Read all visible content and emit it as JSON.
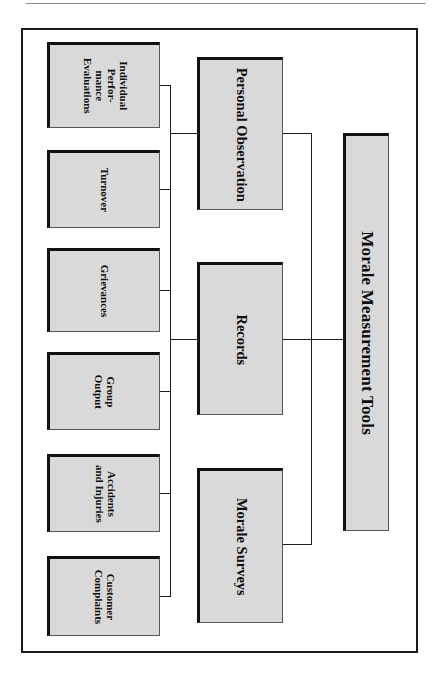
{
  "figure": {
    "type": "org-chart",
    "orientation": "rotated-90-clockwise",
    "title": "Morale Measurement Tools",
    "root": {
      "label": "Morale Measurement Tools"
    },
    "branches": [
      {
        "label": "Personal Observation",
        "children": [
          {
            "label": "Individual\nPerfor-\nmance\nEvaluations"
          },
          {
            "label": "Turnover"
          },
          {
            "label": "Grievances"
          }
        ]
      },
      {
        "label": "Records",
        "children": [
          {
            "label": "Group\nOutput"
          },
          {
            "label": "Accidents\nand Injuries"
          },
          {
            "label": "Customer\nComplaints"
          }
        ]
      },
      {
        "label": "Morale Surveys",
        "children": []
      }
    ],
    "leaves": [
      {
        "label": "Individual\nPerfor-\nmance\nEvaluations"
      },
      {
        "label": "Turnover"
      },
      {
        "label": "Grievances"
      },
      {
        "label": "Group\nOutput"
      },
      {
        "label": "Accidents\nand Injuries"
      },
      {
        "label": "Customer\nComplaints"
      }
    ],
    "mid_nodes": [
      {
        "label": "Personal Observation"
      },
      {
        "label": "Records"
      },
      {
        "label": "Morale Surveys"
      }
    ],
    "colors": {
      "box_fill": "#d9d9d9",
      "box_border": "#111111",
      "frame_border": "#1a1a1a",
      "line": "#1d1d1d",
      "text": "#0d0d0d",
      "page_background": "#ffffff"
    }
  }
}
